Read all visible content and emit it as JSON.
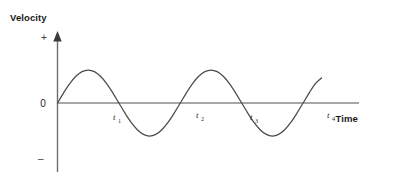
{
  "figure": {
    "background_color": "#ffffff",
    "axis_color": "#6e6e6e",
    "curve_color": "#4a4a4a",
    "text_color": "#1a1a1a",
    "y_axis_title": "Velocity",
    "x_axis_title": "Time",
    "positive_sign": "+",
    "negative_sign": "–",
    "origin_label": "0",
    "tick_labels": [
      {
        "base": "t",
        "sub": "1"
      },
      {
        "base": "t",
        "sub": "2"
      },
      {
        "base": "t",
        "sub": "3"
      },
      {
        "base": "t",
        "sub": "4"
      }
    ]
  },
  "chart_data": {
    "type": "line",
    "title": "",
    "xlabel": "Time",
    "ylabel": "Velocity",
    "grid": false,
    "legend": false,
    "xlim": [
      0,
      4.6
    ],
    "ylim": [
      -1.35,
      1.45
    ],
    "x_tick_labels": [
      "t1",
      "t2",
      "t3",
      "t4"
    ],
    "x_tick_values": [
      1,
      2,
      3,
      4
    ],
    "y_tick_labels": [
      "+",
      "0",
      "–"
    ],
    "y_tick_values": [
      1.35,
      0,
      -1.25
    ],
    "series": [
      {
        "name": "velocity",
        "description": "sine wave, one full cycle per two tick intervals, amplitude 1",
        "x": [
          0,
          0.1,
          0.2,
          0.3,
          0.4,
          0.5,
          0.6,
          0.7,
          0.8,
          0.9,
          1.0,
          1.1,
          1.2,
          1.3,
          1.4,
          1.5,
          1.6,
          1.7,
          1.8,
          1.9,
          2.0,
          2.1,
          2.2,
          2.3,
          2.4,
          2.5,
          2.6,
          2.7,
          2.8,
          2.9,
          3.0,
          3.1,
          3.2,
          3.3,
          3.4,
          3.5,
          3.6,
          3.7,
          3.8,
          3.9,
          4.0,
          4.1,
          4.2,
          4.3
        ],
        "y": [
          0,
          0.309,
          0.588,
          0.809,
          0.951,
          1.0,
          0.951,
          0.809,
          0.588,
          0.309,
          0,
          -0.309,
          -0.588,
          -0.809,
          -0.951,
          -1.0,
          -0.951,
          -0.809,
          -0.588,
          -0.309,
          0,
          0.309,
          0.588,
          0.809,
          0.951,
          1.0,
          0.951,
          0.809,
          0.588,
          0.309,
          0,
          -0.309,
          -0.588,
          -0.809,
          -0.951,
          -1.0,
          -0.951,
          -0.809,
          -0.588,
          -0.309,
          0,
          0.309,
          0.588,
          0.76
        ]
      }
    ]
  }
}
